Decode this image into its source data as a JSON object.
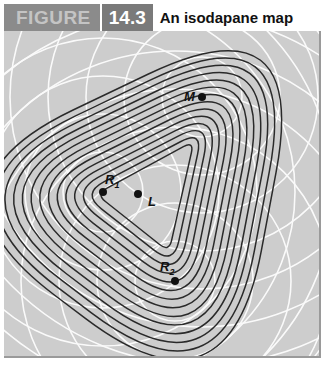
{
  "header": {
    "figure_label": "FIGURE",
    "figure_number": "14.3",
    "title": "An isodapane map"
  },
  "colors": {
    "figure_label_bg": "#8b8b8b",
    "figure_number_bg": "#7a7a7a",
    "map_bg": "#cdcdcd",
    "isodapane_line": "#2a2a2a",
    "isotim_line": "#ffffff"
  },
  "points": {
    "M": {
      "label": "M",
      "sub": "",
      "x": 198,
      "y": 66
    },
    "R1": {
      "label": "R",
      "sub": "1",
      "x": 99,
      "y": 161
    },
    "L": {
      "label": "L",
      "sub": "",
      "x": 134,
      "y": 163
    },
    "R2": {
      "label": "R",
      "sub": "2",
      "x": 171,
      "y": 250
    }
  },
  "diagram": {
    "type": "isodapane map",
    "isodapane_count": 14,
    "isotim_sources": [
      "R1",
      "R2",
      "M"
    ]
  }
}
